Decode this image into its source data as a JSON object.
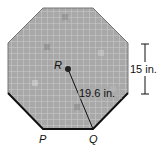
{
  "figure": {
    "shape": "regular octagon (tiled)",
    "center_label": "R",
    "vertex_labels": [
      "P",
      "Q"
    ],
    "radius_label": "19.6 in.",
    "side_label": "15 in.",
    "colors": {
      "tile_base": "#9a9a9a",
      "edge": "#111111",
      "grout": "#bdbdbd"
    }
  }
}
